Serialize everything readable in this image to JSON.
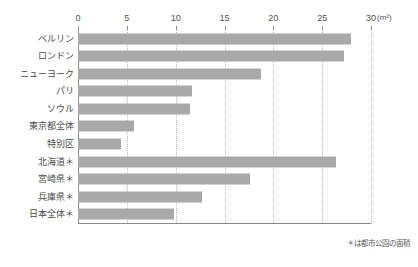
{
  "chart_data": {
    "type": "bar",
    "orientation": "horizontal",
    "title": "",
    "xlabel": "",
    "ylabel": "",
    "unit_label": "(m²)",
    "xlim": [
      0,
      30
    ],
    "xticks": [
      0,
      5,
      10,
      15,
      20,
      25,
      30
    ],
    "xtick_labels": [
      "0",
      "5",
      "10",
      "15",
      "20",
      "25",
      "30"
    ],
    "grid": "vertical-dotted",
    "legend": "none",
    "bar_color": "#a9a9a9",
    "categories": [
      "ベルリン",
      "ロンドン",
      "ニューヨーク",
      "パリ",
      "ソウル",
      "東京都全体",
      "特別区",
      "北海道＊",
      "宮崎県＊",
      "兵庫県＊",
      "日本全体＊"
    ],
    "values": [
      28.0,
      27.2,
      18.7,
      11.7,
      11.5,
      5.7,
      4.4,
      26.4,
      17.6,
      12.7,
      9.8
    ],
    "annotations": [
      "＊は都市公園の面積"
    ]
  },
  "footnote": "＊は都市公園の面積"
}
